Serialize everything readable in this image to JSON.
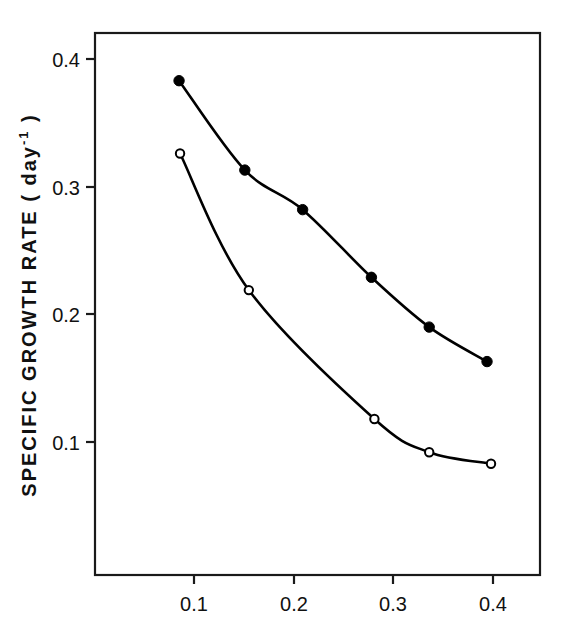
{
  "chart_data": {
    "type": "line",
    "title": "",
    "subtitle": "",
    "xlabel": "",
    "ylabel": "SPECIFIC GROWTH RATE ( day-1 )",
    "ylabel_parts": {
      "main": "SPECIFIC GROWTH RATE ( day",
      "superscript": "-1",
      "tail": " )"
    },
    "xlim": [
      0.055,
      0.4965
    ],
    "ylim": [
      0.0725,
      0.4298
    ],
    "xticks": [
      0.1,
      0.2,
      0.3,
      0.4
    ],
    "xtick_labels": [
      "0.1",
      "0.2",
      "0.3",
      "0.4"
    ],
    "yticks": [
      0.1,
      0.2,
      0.3,
      0.4
    ],
    "ytick_labels": [
      "0.1",
      "0.2",
      "0.3",
      "0.4"
    ],
    "grid": false,
    "legend": "none",
    "frame": "box",
    "series": [
      {
        "name": "filled-circles",
        "marker": "filled-circle",
        "color": "#000000",
        "x": [
          0.085,
          0.151,
          0.209,
          0.278,
          0.336,
          0.394
        ],
        "y": [
          0.383,
          0.313,
          0.282,
          0.229,
          0.19,
          0.163
        ]
      },
      {
        "name": "open-circles",
        "marker": "open-circle",
        "color": "#000000",
        "x": [
          0.086,
          0.155,
          0.281,
          0.336,
          0.398
        ],
        "y": [
          0.326,
          0.219,
          0.118,
          0.092,
          0.083
        ]
      }
    ]
  },
  "axes": {
    "y_tick_0": "0.4",
    "y_tick_1": "0.3",
    "y_tick_2": "0.2",
    "y_tick_3": "0.1",
    "x_tick_0": "0.1",
    "x_tick_1": "0.2",
    "x_tick_2": "0.3",
    "x_tick_3": "0.4"
  }
}
